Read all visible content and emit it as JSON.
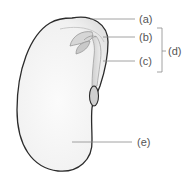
{
  "diagram": {
    "labels": {
      "a": "(a)",
      "b": "(b)",
      "c": "(c)",
      "d": "(d)",
      "e": "(e)"
    },
    "colors": {
      "outline": "#2b2b2b",
      "seed_fill": "#f4f4f4",
      "embryo_fill": "#d9d9d9",
      "label_text": "#555555",
      "leader_line": "#8a8a8a"
    }
  }
}
